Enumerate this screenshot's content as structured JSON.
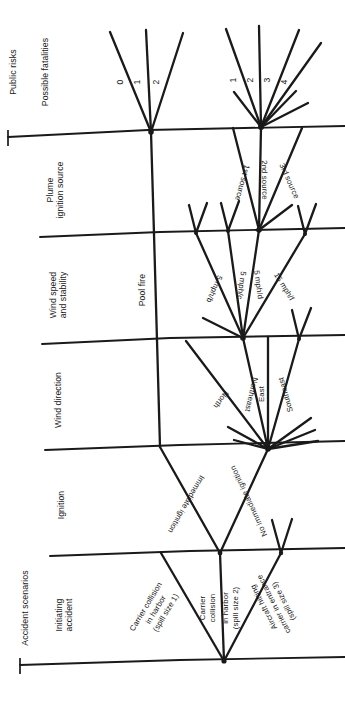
{
  "diagram": {
    "type": "event-tree",
    "orientation": "rotated-90-ccw",
    "groups": [
      {
        "id": "public-risks",
        "label": "Public risks"
      },
      {
        "id": "accident-scenarios",
        "label": "Accident scenarios"
      }
    ],
    "columns": [
      {
        "id": "possible-fatalities",
        "label": "Possible fatalities"
      },
      {
        "id": "plume-ignition-source",
        "label_line1": "Plume",
        "label_line2": "ignition source"
      },
      {
        "id": "wind-speed-and-stability",
        "label_line1": "Wind speed",
        "label_line2": "and stability"
      },
      {
        "id": "wind-direction",
        "label": "Wind direction"
      },
      {
        "id": "ignition",
        "label": "Ignition"
      },
      {
        "id": "initiating-accident",
        "label_line1": "Initiating",
        "label_line2": "accident"
      }
    ],
    "branches": {
      "initiating_accident": [
        {
          "id": "carrier-collision-harbor",
          "line1": "Carrier collision",
          "line2": "in harbor",
          "line3": "(spill size 1)"
        },
        {
          "id": "carrier-collision-entrance",
          "line1": "Carrier",
          "line2": "collision",
          "line3": "in harbor",
          "line4": "(spill size 2)"
        },
        {
          "id": "aircraft-hitting-carrier",
          "line1": "Aircraft hitting",
          "line2": "carrier in entrance",
          "line3": "(spill size 3)"
        }
      ],
      "ignition": [
        {
          "id": "immediate-ignition",
          "label": "Immediate ignition"
        },
        {
          "id": "no-immediate-ignition",
          "label": "No immediate ignition"
        }
      ],
      "pool_fire": {
        "id": "pool-fire",
        "label": "Pool fire"
      },
      "wind_direction": [
        {
          "id": "north",
          "label": "North"
        },
        {
          "id": "northeast",
          "label": "Northeast"
        },
        {
          "id": "east",
          "label": "East"
        },
        {
          "id": "southeast",
          "label": "Southeast"
        }
      ],
      "wind_speed": [
        {
          "id": "5-mph-b",
          "label": "5 mph/b"
        },
        {
          "id": "5-mph-c",
          "label": "5 mph/c"
        },
        {
          "id": "5-mph-d",
          "label": "5 mph/d"
        },
        {
          "id": "15-mph-f",
          "label": "15 mph/f"
        }
      ],
      "ignition_source": [
        {
          "id": "1st-source",
          "label": "1st source"
        },
        {
          "id": "2nd-source",
          "label": "2nd source"
        },
        {
          "id": "3rd-source",
          "label": "3rd source"
        }
      ],
      "fatalities_pool_fire": [
        {
          "id": "fatalities-0",
          "label": "0"
        },
        {
          "id": "fatalities-1",
          "label": "1"
        },
        {
          "id": "fatalities-2",
          "label": "2"
        }
      ],
      "fatalities_plume": [
        {
          "id": "fatalities-p1",
          "label": "1"
        },
        {
          "id": "fatalities-p2",
          "label": "2"
        },
        {
          "id": "fatalities-p3",
          "label": "3"
        },
        {
          "id": "fatalities-p4",
          "label": "4"
        }
      ]
    },
    "colors": {
      "ink": "#171717",
      "line": "#1a1a1a",
      "paper": "#ffffff"
    }
  }
}
